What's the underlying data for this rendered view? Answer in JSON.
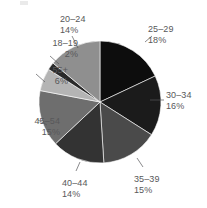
{
  "figure": {
    "background_color": "#ffffff",
    "label_color": "#58585a",
    "corner_mark": "crop-artifact"
  },
  "chart_data": {
    "type": "pie",
    "title": "",
    "subtitle": "",
    "xlabel": "",
    "ylabel": "",
    "legend_position": "none",
    "grid": false,
    "labels_inline": true,
    "start_angle_deg": 0,
    "direction": "clockwise",
    "center": {
      "x": 100,
      "y": 102
    },
    "radius": 61,
    "categories": [
      "25–29",
      "30–34",
      "35–39",
      "40–44",
      "45–54",
      "55+",
      "18–19",
      "20–24"
    ],
    "values": [
      18,
      16,
      15,
      14,
      15,
      6,
      2,
      14
    ],
    "value_suffix": "%",
    "colors": [
      "#0d0d0d",
      "#1b1b1b",
      "#4a4a4a",
      "#333333",
      "#6e6e6e",
      "#b4b4b4",
      "#2a2a2a",
      "#8f8f8f"
    ],
    "slices": [
      {
        "label": "25–29",
        "percent_text": "18%",
        "value": 18,
        "color": "#0d0d0d",
        "start_deg": 0,
        "end_deg": 64.8,
        "label_x": 148,
        "label_y": 24,
        "label_align": "left",
        "leader": {
          "x1": 145,
          "y1": 42,
          "x2": 152,
          "y2": 36
        }
      },
      {
        "label": "30–34",
        "percent_text": "16%",
        "value": 16,
        "color": "#1b1b1b",
        "start_deg": 64.8,
        "end_deg": 122.4,
        "label_x": 166,
        "label_y": 90,
        "label_align": "left",
        "leader": {
          "x1": 150,
          "y1": 100,
          "x2": 164,
          "y2": 100
        }
      },
      {
        "label": "35–39",
        "percent_text": "15%",
        "value": 15,
        "color": "#4a4a4a",
        "start_deg": 122.4,
        "end_deg": 176.4,
        "label_x": 134,
        "label_y": 174,
        "label_align": "left",
        "leader": {
          "x1": 137,
          "y1": 158,
          "x2": 143,
          "y2": 167
        }
      },
      {
        "label": "40–44",
        "percent_text": "14%",
        "value": 14,
        "color": "#333333",
        "start_deg": 176.4,
        "end_deg": 226.8,
        "label_x": 62,
        "label_y": 178,
        "label_align": "left",
        "leader": {
          "x1": 80,
          "y1": 162,
          "x2": 76,
          "y2": 171
        }
      },
      {
        "label": "45–54",
        "percent_text": "15%",
        "value": 15,
        "color": "#6e6e6e",
        "start_deg": 226.8,
        "end_deg": 280.8,
        "label_x": 4,
        "label_y": 116,
        "label_align": "right",
        "leader": {
          "x1": 47,
          "y1": 125,
          "x2": 38,
          "y2": 120
        }
      },
      {
        "label": "55+",
        "percent_text": "6%",
        "value": 6,
        "color": "#b4b4b4",
        "start_deg": 280.8,
        "end_deg": 302.4,
        "label_x": 12,
        "label_y": 65,
        "label_align": "right",
        "leader": {
          "x1": 45,
          "y1": 82,
          "x2": 36,
          "y2": 74
        }
      },
      {
        "label": "18–19",
        "percent_text": "2%",
        "value": 2,
        "color": "#2a2a2a",
        "start_deg": 302.4,
        "end_deg": 309.6,
        "label_x": 22,
        "label_y": 38,
        "label_align": "right",
        "leader": {
          "x1": 59,
          "y1": 64,
          "x2": 50,
          "y2": 56
        }
      },
      {
        "label": "20–24",
        "percent_text": "14%",
        "value": 14,
        "color": "#8f8f8f",
        "start_deg": 309.6,
        "end_deg": 360,
        "label_x": 60,
        "label_y": 14,
        "label_align": "left",
        "leader": {
          "x1": 78,
          "y1": 48,
          "x2": 72,
          "y2": 36
        }
      }
    ]
  }
}
